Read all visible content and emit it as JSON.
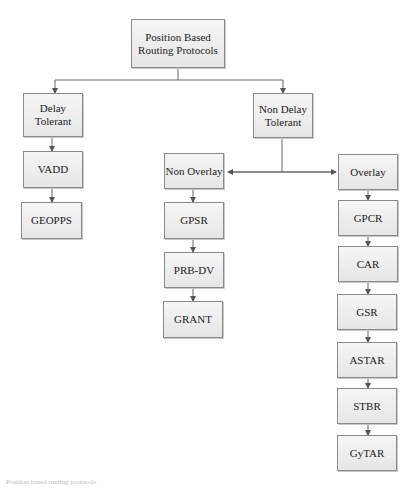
{
  "diagram": {
    "root": "Position Based Routing Protocols",
    "branches": {
      "delay_tolerant": {
        "label": "Delay Tolerant",
        "children": [
          "VADD",
          "GEOPPS"
        ]
      },
      "non_delay_tolerant": {
        "label": "Non Delay Tolerant",
        "non_overlay": {
          "label": "Non Overlay",
          "children": [
            "GPSR",
            "PRB-DV",
            "GRANT"
          ]
        },
        "overlay": {
          "label": "Overlay",
          "children": [
            "GPCR",
            "CAR",
            "GSR",
            "ASTAR",
            "STBR",
            "GyTAR"
          ]
        }
      }
    },
    "caption": "Position based routing protocols"
  }
}
